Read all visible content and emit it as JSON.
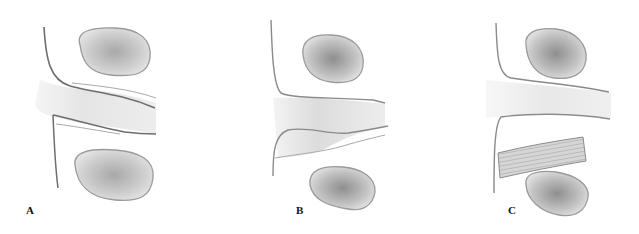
{
  "figure": {
    "panels": [
      {
        "id": "A",
        "label": "A"
      },
      {
        "id": "B",
        "label": "B"
      },
      {
        "id": "C",
        "label": "C"
      }
    ],
    "colors": {
      "outline": "#8a8a8a",
      "dark_outline": "#6e6e6e",
      "nucleus_fill": "#c9c9c9",
      "nucleus_core": "#9a9a9a",
      "channel_fill": "#e6e6e6"
    }
  }
}
